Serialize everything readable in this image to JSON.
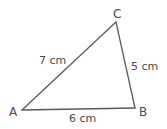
{
  "diagram": {
    "type": "triangle",
    "vertices": [
      {
        "name": "A",
        "x": 22,
        "y": 110
      },
      {
        "name": "B",
        "x": 135,
        "y": 108
      },
      {
        "name": "C",
        "x": 116,
        "y": 22
      }
    ],
    "sides": [
      {
        "from": "A",
        "to": "B",
        "label": "6 cm"
      },
      {
        "from": "B",
        "to": "C",
        "label": "5 cm"
      },
      {
        "from": "A",
        "to": "C",
        "label": "7 cm"
      }
    ],
    "labels": {
      "vertex_a": "A",
      "vertex_b": "B",
      "vertex_c": "C",
      "side_ab": "6 cm",
      "side_bc": "5 cm",
      "side_ac": "7 cm"
    },
    "colors": {
      "line": "#5a5a5a",
      "text": "#4a4a4a",
      "background": "#ffffff"
    }
  }
}
